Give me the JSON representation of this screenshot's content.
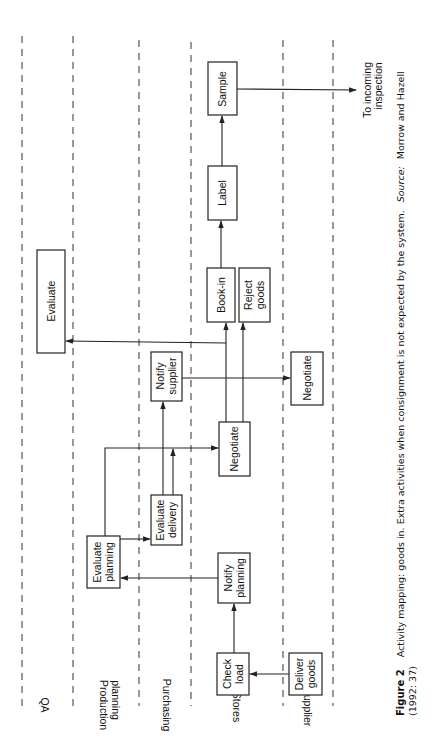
{
  "figure": {
    "orientation": "rotated 90 degrees clockwise (landscape figure on portrait page)",
    "lanes": [
      {
        "id": "qa",
        "label": "QA"
      },
      {
        "id": "production",
        "label_line1": "Production",
        "label_line2": "planning"
      },
      {
        "id": "purchasing",
        "label": "Purchasing"
      },
      {
        "id": "stores",
        "label": "Stores"
      },
      {
        "id": "supplier",
        "label": "Supplier"
      }
    ],
    "boxes": {
      "deliver_goods": {
        "line1": "Deliver",
        "line2": "goods",
        "lane": "Supplier"
      },
      "check_load": {
        "line1": "Check",
        "line2": "load",
        "lane": "Stores"
      },
      "notify_planning": {
        "line1": "Notify",
        "line2": "planning",
        "lane": "Stores"
      },
      "evaluate_planning": {
        "line1": "Evaluate",
        "line2": "planning",
        "lane": "Production planning"
      },
      "evaluate_delivery": {
        "line1": "Evaluate",
        "line2": "delivery",
        "lane": "Purchasing"
      },
      "negotiate_stores": {
        "line1": "Negotiate",
        "lane": "Stores"
      },
      "notify_supplier": {
        "line1": "Notify",
        "line2": "supplier",
        "lane": "Purchasing"
      },
      "negotiate_supplier": {
        "line1": "Negotiate",
        "lane": "Supplier"
      },
      "evaluate": {
        "line1": "Evaluate",
        "lane": "QA"
      },
      "book_in": {
        "line1": "Book-in",
        "lane": "Stores"
      },
      "reject_goods": {
        "line1": "Reject",
        "line2": "goods",
        "lane": "Stores"
      },
      "label": {
        "line1": "Label",
        "lane": "Stores"
      },
      "sample": {
        "line1": "Sample",
        "lane": "Stores"
      }
    },
    "flows": [
      {
        "from": "Deliver goods",
        "to": "Check load"
      },
      {
        "from": "Check load",
        "to": "Notify planning"
      },
      {
        "from": "Notify planning",
        "to": "Evaluate planning"
      },
      {
        "from": "Evaluate planning",
        "to": "Evaluate delivery"
      },
      {
        "from": "Evaluate planning",
        "to": "Negotiate (Stores)"
      },
      {
        "from": "Evaluate delivery",
        "to": "Notify supplier"
      },
      {
        "from": "Evaluate delivery",
        "to": "Negotiate (Stores)"
      },
      {
        "from": "Notify supplier",
        "to": "Negotiate (Supplier)"
      },
      {
        "from": "Negotiate (Stores)",
        "to": "Book-in"
      },
      {
        "from": "Negotiate (Stores)",
        "to": "Reject goods"
      },
      {
        "from": "Negotiate (Stores)",
        "to": "Evaluate (QA)"
      },
      {
        "from": "Book-in",
        "to": "Label"
      },
      {
        "from": "Label",
        "to": "Sample"
      },
      {
        "from": "Sample",
        "to": "To incoming inspection"
      }
    ],
    "exit_note": {
      "line1": "To incoming",
      "line2": "inspection"
    }
  },
  "caption": {
    "number": "Figure 2",
    "text": "Activity mapping: goods in. Extra activities when consignment is not expected by the system.",
    "source_label": "Source:",
    "source_text": "Morrow and Hazell",
    "source_year": "(1992: 37)"
  }
}
